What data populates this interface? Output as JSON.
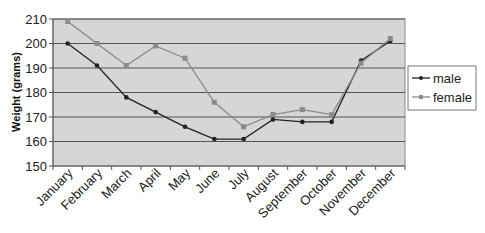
{
  "chart_data": {
    "type": "line",
    "title": "",
    "xlabel": "",
    "ylabel": "Weight (grams)",
    "ylim": [
      150,
      210
    ],
    "yticks": [
      150,
      160,
      170,
      180,
      190,
      200,
      210
    ],
    "grid": true,
    "legend_position": "right",
    "categories": [
      "January",
      "February",
      "March",
      "April",
      "May",
      "June",
      "July",
      "August",
      "September",
      "October",
      "November",
      "December"
    ],
    "series": [
      {
        "name": "male",
        "color": "#222222",
        "marker": "diamond",
        "values": [
          200,
          191,
          178,
          172,
          166,
          161,
          161,
          169,
          168,
          168,
          193,
          201
        ]
      },
      {
        "name": "female",
        "color": "#8a8a8a",
        "marker": "square",
        "values": [
          209,
          200,
          191,
          199,
          194,
          176,
          166,
          171,
          173,
          171,
          192,
          202
        ]
      }
    ]
  },
  "colors": {
    "plot_background": "#d6d6d6",
    "gridline": "#555555",
    "axis": "#555555"
  }
}
